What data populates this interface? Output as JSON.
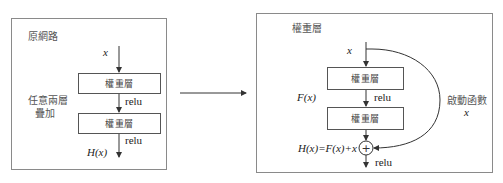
{
  "left_panel": {
    "title": "原網路",
    "side_label_line1": "任意兩層",
    "side_label_line2": "疊加",
    "input_label": "x",
    "layers": [
      {
        "label": "權重層",
        "activation": "relu"
      },
      {
        "label": "權重層",
        "activation": "relu"
      }
    ],
    "output_label": "H(x)"
  },
  "transition_arrow": {
    "direction": "right"
  },
  "right_panel": {
    "title": "權重層",
    "input_label": "x",
    "layers": [
      {
        "label": "權重層",
        "activation": "relu"
      },
      {
        "label": "權重層"
      }
    ],
    "residual_label": "F(x)",
    "skip_label_line1": "啟動函數",
    "skip_label_line2": "x",
    "sum_symbol": "+",
    "sum_equation": "H(x)=F(x)+x",
    "output_activation": "relu"
  },
  "colors": {
    "panel_border": "#8a8a8a",
    "line": "#333333",
    "text": "#444444"
  }
}
